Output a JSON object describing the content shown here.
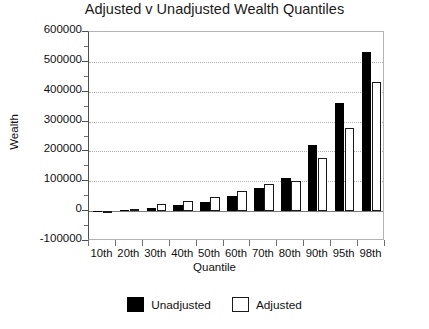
{
  "chart_data": {
    "type": "bar",
    "title": "Adjusted v Unadjusted Wealth Quantiles",
    "xlabel": "Quantile",
    "ylabel": "Wealth",
    "categories": [
      "10th",
      "20th",
      "30th",
      "40th",
      "50th",
      "60th",
      "70th",
      "80th",
      "90th",
      "95th",
      "98th"
    ],
    "series": [
      {
        "name": "Unadjusted",
        "color": "#000000",
        "values": [
          800,
          4000,
          11000,
          19000,
          32000,
          52000,
          78000,
          112000,
          222000,
          362000,
          534000
        ]
      },
      {
        "name": "Adjusted",
        "color": "#ffffff",
        "values": [
          500,
          7000,
          25000,
          35000,
          49000,
          66000,
          92000,
          101000,
          178000,
          280000,
          434000
        ]
      }
    ],
    "ylim": [
      -100000,
      600000
    ],
    "yticks": [
      -100000,
      0,
      100000,
      200000,
      300000,
      400000,
      500000,
      600000
    ],
    "ytick_labels": [
      "-100000",
      "0",
      "100000",
      "200000",
      "300000",
      "400000",
      "500000",
      "600000"
    ],
    "y_minor_ticks": [
      -50000,
      50000,
      150000,
      250000,
      350000,
      450000,
      550000
    ],
    "grid": true,
    "grid_axis": "y",
    "legend": {
      "position": "bottom",
      "entries": [
        {
          "label": "Unadjusted",
          "swatch": "filled-black-square"
        },
        {
          "label": "Adjusted",
          "swatch": "open-white-square"
        }
      ]
    }
  }
}
